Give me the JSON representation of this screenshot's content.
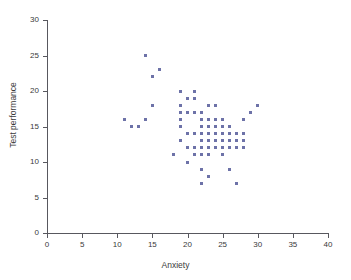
{
  "chart_data": {
    "type": "scatter",
    "title": "",
    "xlabel": "Anxiety",
    "ylabel": "Test performance",
    "xlim": [
      0,
      40
    ],
    "ylim": [
      0,
      30
    ],
    "xticks": [
      0,
      5,
      10,
      15,
      20,
      25,
      30,
      35,
      40
    ],
    "yticks": [
      0,
      5,
      10,
      15,
      20,
      25,
      30
    ],
    "grid": false,
    "legend": null,
    "marker_color": "#6d72a8",
    "marker_shape": "square",
    "series": [
      {
        "name": "observations",
        "points": [
          [
            11,
            16
          ],
          [
            12,
            15
          ],
          [
            13,
            15
          ],
          [
            14,
            16
          ],
          [
            14,
            25
          ],
          [
            15,
            18
          ],
          [
            15,
            22
          ],
          [
            16,
            23
          ],
          [
            18,
            11
          ],
          [
            19,
            13
          ],
          [
            19,
            15
          ],
          [
            19,
            16
          ],
          [
            19,
            17
          ],
          [
            19,
            18
          ],
          [
            19,
            20
          ],
          [
            20,
            10
          ],
          [
            20,
            12
          ],
          [
            20,
            14
          ],
          [
            20,
            17
          ],
          [
            20,
            19
          ],
          [
            21,
            11
          ],
          [
            21,
            12
          ],
          [
            21,
            14
          ],
          [
            21,
            17
          ],
          [
            21,
            19
          ],
          [
            21,
            20
          ],
          [
            22,
            7
          ],
          [
            22,
            9
          ],
          [
            22,
            11
          ],
          [
            22,
            12
          ],
          [
            22,
            13
          ],
          [
            22,
            14
          ],
          [
            22,
            15
          ],
          [
            22,
            16
          ],
          [
            22,
            17
          ],
          [
            23,
            8
          ],
          [
            23,
            11
          ],
          [
            23,
            12
          ],
          [
            23,
            13
          ],
          [
            23,
            14
          ],
          [
            23,
            15
          ],
          [
            23,
            16
          ],
          [
            23,
            18
          ],
          [
            24,
            12
          ],
          [
            24,
            13
          ],
          [
            24,
            14
          ],
          [
            24,
            15
          ],
          [
            24,
            16
          ],
          [
            24,
            18
          ],
          [
            25,
            11
          ],
          [
            25,
            12
          ],
          [
            25,
            13
          ],
          [
            25,
            14
          ],
          [
            25,
            15
          ],
          [
            25,
            16
          ],
          [
            26,
            9
          ],
          [
            26,
            12
          ],
          [
            26,
            13
          ],
          [
            26,
            14
          ],
          [
            26,
            15
          ],
          [
            27,
            7
          ],
          [
            27,
            12
          ],
          [
            27,
            13
          ],
          [
            27,
            14
          ],
          [
            28,
            12
          ],
          [
            28,
            13
          ],
          [
            28,
            14
          ],
          [
            28,
            16
          ],
          [
            29,
            17
          ],
          [
            30,
            18
          ]
        ]
      }
    ]
  }
}
